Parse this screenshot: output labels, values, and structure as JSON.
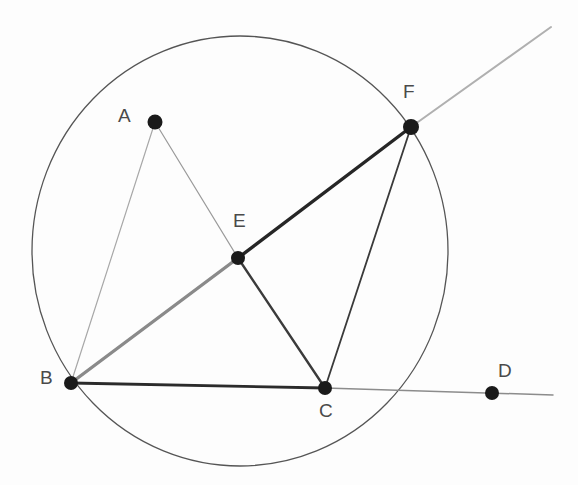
{
  "figure": {
    "background_color": "#fdfdfd",
    "width": 578,
    "height": 485
  },
  "colors": {
    "circle_stroke": "#555555",
    "line_dark": "#2b2b2b",
    "line_medium": "#6e6e6e",
    "line_light": "#9a9a9a",
    "line_faint": "#b4b4b4",
    "point_fill": "#1a1a1a",
    "label_color": "#4a4a4a"
  },
  "circle": {
    "name": "main-circle",
    "cx": 240,
    "cy": 251,
    "rx": 208,
    "ry": 215,
    "stroke_width": 1.3
  },
  "points": [
    {
      "id": "A",
      "label": "A",
      "x": 155,
      "y": 122,
      "r": 7.5,
      "label_x": 118,
      "label_y": 106
    },
    {
      "id": "B",
      "label": "B",
      "x": 71,
      "y": 383,
      "r": 7.0,
      "label_x": 40,
      "label_y": 368
    },
    {
      "id": "C",
      "label": "C",
      "x": 325,
      "y": 388,
      "r": 7.0,
      "label_x": 319,
      "label_y": 401
    },
    {
      "id": "D",
      "label": "D",
      "x": 492,
      "y": 393,
      "r": 7.0,
      "label_x": 498,
      "label_y": 361
    },
    {
      "id": "E",
      "label": "E",
      "x": 238,
      "y": 258,
      "r": 7.0,
      "label_x": 233,
      "label_y": 211
    },
    {
      "id": "F",
      "label": "F",
      "x": 411,
      "y": 127,
      "r": 8.0,
      "label_x": 403,
      "label_y": 82
    }
  ],
  "segments": [
    {
      "name": "segment-A-B",
      "from": "A",
      "to": "B",
      "x1": 155,
      "y1": 122,
      "x2": 71,
      "y2": 383,
      "stroke": "#a8a8a8",
      "width": 1.2
    },
    {
      "name": "segment-A-E",
      "from": "A",
      "to": "E",
      "x1": 155,
      "y1": 122,
      "x2": 238,
      "y2": 258,
      "stroke": "#9a9a9a",
      "width": 1.2
    },
    {
      "name": "segment-B-E",
      "from": "B",
      "to": "E",
      "x1": 71,
      "y1": 383,
      "x2": 238,
      "y2": 258,
      "stroke": "#8a8a8a",
      "width": 3.4
    },
    {
      "name": "segment-E-F",
      "from": "E",
      "to": "F",
      "x1": 238,
      "y1": 258,
      "x2": 411,
      "y2": 127,
      "stroke": "#262626",
      "width": 3.4
    },
    {
      "name": "ray-F-beyond",
      "from": "F",
      "to": "ray-end",
      "x1": 411,
      "y1": 127,
      "x2": 551,
      "y2": 27,
      "stroke": "#b0b0b0",
      "width": 2.0
    },
    {
      "name": "segment-E-C",
      "from": "E",
      "to": "C",
      "x1": 238,
      "y1": 258,
      "x2": 325,
      "y2": 388,
      "stroke": "#3b3b3b",
      "width": 2.4
    },
    {
      "name": "segment-F-C",
      "from": "F",
      "to": "C",
      "x1": 411,
      "y1": 127,
      "x2": 325,
      "y2": 388,
      "stroke": "#3a3a3a",
      "width": 1.8
    },
    {
      "name": "segment-B-C",
      "from": "B",
      "to": "C",
      "x1": 71,
      "y1": 383,
      "x2": 325,
      "y2": 388,
      "stroke": "#2b2b2b",
      "width": 2.8
    },
    {
      "name": "segment-C-D-extended",
      "from": "C",
      "to": "line-end",
      "x1": 325,
      "y1": 388,
      "x2": 553,
      "y2": 395,
      "stroke": "#8c8c8c",
      "width": 1.5
    }
  ]
}
